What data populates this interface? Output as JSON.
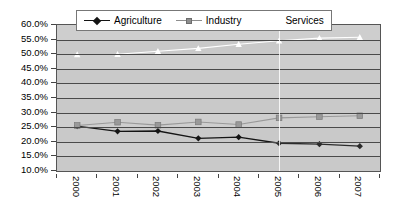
{
  "chart_data": {
    "type": "line",
    "title": "",
    "subtitle": "",
    "xlabel": "",
    "ylabel": "",
    "categories": [
      "2000",
      "2001",
      "2002",
      "2003",
      "2004",
      "2005",
      "2006",
      "2007"
    ],
    "ylim": [
      10,
      60
    ],
    "ytick_labels": [
      "60.0%",
      "55.0%",
      "50.0%",
      "45.0%",
      "40.0%",
      "35.0%",
      "30.0%",
      "25.0%",
      "20.0%",
      "15.0%",
      "10.0%"
    ],
    "ytick_values": [
      60,
      55,
      50,
      45,
      40,
      35,
      30,
      25,
      20,
      15,
      10
    ],
    "grid": true,
    "legend_position": "top",
    "series": [
      {
        "name": "Agriculture",
        "marker": "diamond",
        "color": "#141414",
        "values": [
          25.4,
          23.6,
          23.7,
          21.2,
          21.6,
          19.5,
          19.2,
          18.5
        ]
      },
      {
        "name": "Industry",
        "marker": "square",
        "color": "#8e8e8e",
        "values": [
          25.6,
          26.7,
          25.7,
          26.8,
          25.9,
          28.2,
          28.6,
          28.9
        ]
      },
      {
        "name": "Services",
        "marker": "triangle",
        "color": "#ffffff",
        "values": [
          49.9,
          50.0,
          51.0,
          52.0,
          53.4,
          54.6,
          55.5,
          55.8
        ]
      }
    ]
  },
  "legend": {
    "items": [
      {
        "label": "Agriculture",
        "marker": "diamond",
        "color": "#141414"
      },
      {
        "label": "Industry",
        "marker": "square",
        "color": "#8e8e8e"
      },
      {
        "label": "Services",
        "marker": "triangle",
        "color": "#ffffff"
      }
    ]
  },
  "colors": {
    "plot_background": "#c9c9c9",
    "gridline": "#4a4a4a",
    "agriculture": "#141414",
    "industry": "#8e8e8e",
    "services": "#ffffff"
  }
}
